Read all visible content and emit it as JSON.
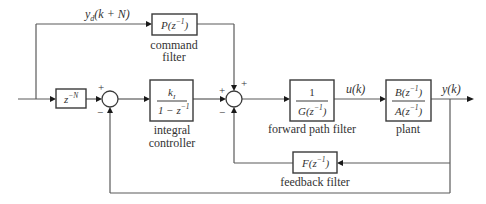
{
  "diagram": {
    "signals": {
      "reference": "y_d(k + N)",
      "reference_main": "y",
      "reference_sub": "d",
      "reference_arg": "(k + N)",
      "control": "u(k)",
      "output": "y(k)"
    },
    "blocks": {
      "delay": {
        "base": "z",
        "exp": "−N",
        "text": "z^-N"
      },
      "command_filter": {
        "expr": "P(z",
        "exp": "−1",
        "close": ")",
        "caption_line1": "command",
        "caption_line2": "filter"
      },
      "integral_controller": {
        "num_base": "k",
        "num_sub": "I",
        "den": "1 − z",
        "den_exp": "−1",
        "caption_line1": "integral",
        "caption_line2": "controller"
      },
      "forward_path_filter": {
        "num": "1",
        "den": "G(z",
        "den_exp": "−1",
        "den_close": ")",
        "caption": "forward path filter"
      },
      "plant": {
        "num": "B(z",
        "num_exp": "−1",
        "num_close": ")",
        "den": "A(z",
        "den_exp": "−1",
        "den_close": ")",
        "caption": "plant"
      },
      "feedback_filter": {
        "expr": "F(z",
        "exp": "−1",
        "close": ")",
        "caption": "feedback filter"
      }
    },
    "summing_junctions": [
      {
        "id": "sum1",
        "signs": {
          "top_left": "+",
          "bottom_left": "−"
        }
      },
      {
        "id": "sum2",
        "signs": {
          "top_right": "+",
          "left": "+",
          "bottom_left": "−"
        }
      }
    ],
    "colors": {
      "line": "#5a5a5a",
      "box_border": "#3a3a3a",
      "text": "#333333",
      "background": "#ffffff"
    }
  }
}
